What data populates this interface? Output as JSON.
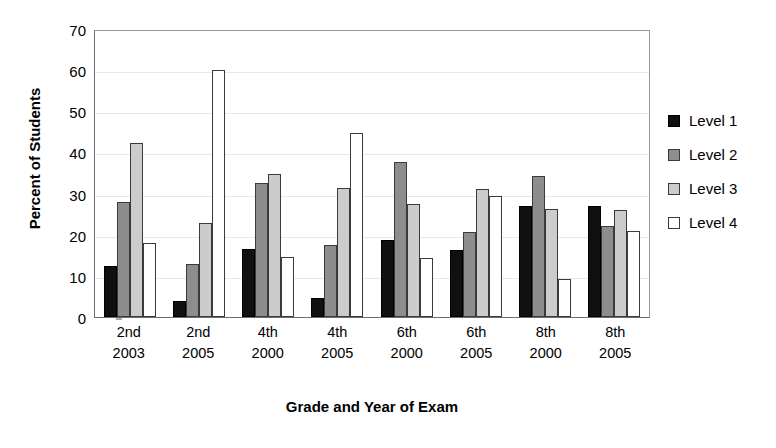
{
  "chart_data": {
    "type": "bar",
    "title": "",
    "xlabel": "Grade and Year of Exam",
    "ylabel": "Percent of Students",
    "ylim": [
      0,
      70
    ],
    "yticks": [
      0,
      10,
      20,
      30,
      40,
      50,
      60,
      70
    ],
    "grid": "horizontal-light",
    "legend_position": "right",
    "categories": [
      {
        "grade": "2nd",
        "year": "2003"
      },
      {
        "grade": "2nd",
        "year": "2005"
      },
      {
        "grade": "4th",
        "year": "2000"
      },
      {
        "grade": "4th",
        "year": "2005"
      },
      {
        "grade": "6th",
        "year": "2000"
      },
      {
        "grade": "6th",
        "year": "2005"
      },
      {
        "grade": "8th",
        "year": "2000"
      },
      {
        "grade": "8th",
        "year": "2005"
      }
    ],
    "series": [
      {
        "name": "Level 1",
        "color": "#101010",
        "values": [
          12.4,
          4.0,
          16.6,
          4.6,
          18.8,
          16.4,
          27.0,
          27.0
        ]
      },
      {
        "name": "Level 2",
        "color": "#8d8d8d",
        "values": [
          28.0,
          13.0,
          32.6,
          17.6,
          37.7,
          20.6,
          34.2,
          22.1
        ]
      },
      {
        "name": "Level 3",
        "color": "#cccccc",
        "values": [
          42.2,
          22.9,
          34.8,
          31.3,
          27.4,
          31.1,
          26.2,
          25.9
        ]
      },
      {
        "name": "Level 4",
        "color": "#ffffff",
        "values": [
          17.9,
          60.0,
          14.6,
          44.8,
          14.3,
          29.5,
          9.2,
          20.8
        ]
      }
    ]
  },
  "legend": {
    "items": [
      {
        "label": "Level 1"
      },
      {
        "label": "Level 2"
      },
      {
        "label": "Level 3"
      },
      {
        "label": "Level 4"
      }
    ]
  }
}
